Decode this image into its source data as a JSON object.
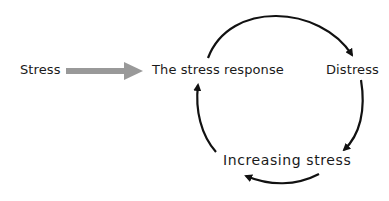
{
  "diagram": {
    "type": "cycle",
    "input_label": "Stress",
    "nodes": [
      {
        "id": "response",
        "label": "The stress response"
      },
      {
        "id": "distress",
        "label": "Distress"
      },
      {
        "id": "increasing",
        "label": "Increasing stress"
      }
    ],
    "edges": [
      {
        "from": "Stress",
        "to": "The stress response",
        "style": "gray-block-arrow"
      },
      {
        "from": "The stress response",
        "to": "Distress",
        "style": "curved-black-arrow"
      },
      {
        "from": "Distress",
        "to": "Increasing stress",
        "style": "curved-black-arrow"
      },
      {
        "from": "Increasing stress",
        "to": "Increasing stress (loop)",
        "style": "curved-black-arrow"
      },
      {
        "from": "Increasing stress",
        "to": "The stress response",
        "style": "curved-black-arrow"
      }
    ],
    "colors": {
      "input_arrow": "#999999",
      "cycle_arrows": "#111111",
      "text": "#1a1a1a"
    }
  }
}
